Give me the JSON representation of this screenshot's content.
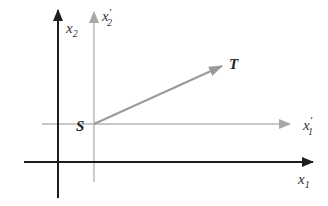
{
  "diagram": {
    "type": "coordinate-frames",
    "colors": {
      "primary_axes": "#1e1e1e",
      "secondary_axes": "#a8a8a8",
      "vector": "#9a9a9a",
      "label": "#333333"
    },
    "primary_frame": {
      "x_axis_label": "x",
      "x_axis_sub": "1",
      "y_axis_label": "x",
      "y_axis_sub": "2"
    },
    "secondary_frame": {
      "x_axis_label": "x",
      "x_axis_sub": "1",
      "x_axis_prime": "′",
      "y_axis_label": "x",
      "y_axis_sub": "2",
      "y_axis_prime": "′"
    },
    "points": {
      "origin_label": "S",
      "target_label": "T"
    }
  }
}
